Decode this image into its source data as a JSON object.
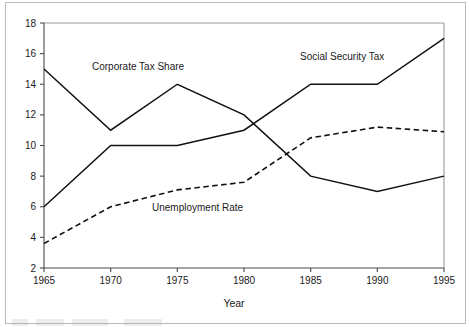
{
  "chart_data": {
    "type": "line",
    "title": "",
    "xlabel": "Year",
    "ylabel": "",
    "x": [
      1965,
      1970,
      1975,
      1980,
      1985,
      1990,
      1995
    ],
    "xtick_labels": [
      "1965",
      "1970",
      "1975",
      "1980",
      "1985",
      "1990",
      "1995"
    ],
    "ytick_labels": [
      "2",
      "4",
      "6",
      "8",
      "10",
      "12",
      "14",
      "16",
      "18"
    ],
    "xlim": [
      1965,
      1995
    ],
    "ylim": [
      2,
      18
    ],
    "grid": false,
    "legend_position": "inline-annotations",
    "series": [
      {
        "name": "Corporate Tax Share",
        "style": "solid",
        "color": "#111111",
        "values": [
          15,
          11,
          14,
          12,
          8,
          7,
          8
        ],
        "label_x": 1968.6,
        "label_y": 14.9
      },
      {
        "name": "Social Security Tax",
        "style": "solid",
        "color": "#111111",
        "values": [
          6,
          10,
          10,
          11,
          14,
          14,
          17
        ],
        "label_x": 1984.2,
        "label_y": 15.6
      },
      {
        "name": "Unemployment Rate",
        "style": "dashed",
        "color": "#111111",
        "values": [
          3.6,
          6.0,
          7.1,
          7.6,
          10.5,
          11.2,
          10.9
        ],
        "label_x": 1973.1,
        "label_y": 5.7
      }
    ]
  },
  "annotations": {
    "corporate_tax_share": "Corporate Tax Share",
    "social_security_tax": "Social Security Tax",
    "unemployment_rate": "Unemployment Rate"
  },
  "axes": {
    "x_axis_title": "Year"
  }
}
